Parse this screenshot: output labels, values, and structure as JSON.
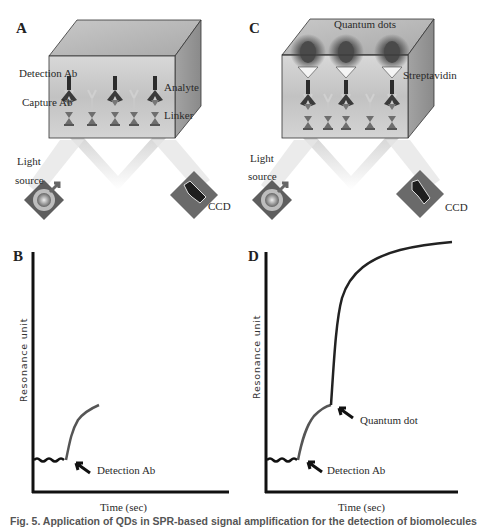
{
  "panels": {
    "A": {
      "letter": "A",
      "labels": {
        "detection_ab": "Detection Ab",
        "capture_ab": "Capture Ab",
        "analyte": "Analyte",
        "linker": "Linker",
        "light_source_1": "Light",
        "light_source_2": "source",
        "ccd": "CCD"
      }
    },
    "B": {
      "letter": "B",
      "ylabel": "Resonance unit",
      "xlabel": "Time (sec)",
      "annotations": [
        "Detection Ab"
      ]
    },
    "C": {
      "letter": "C",
      "labels": {
        "quantum_dots": "Quantum dots",
        "streptavidin": "Streptavidin",
        "light_source_1": "Light",
        "light_source_2": "source",
        "ccd": "CCD"
      }
    },
    "D": {
      "letter": "D",
      "ylabel": "Resonance unit",
      "xlabel": "Time (sec)",
      "annotations": [
        "Quantum dot",
        "Detection Ab"
      ]
    }
  },
  "caption": "Fig. 5. Application of QDs in SPR-based signal amplification for the detection of biomolecules",
  "colors": {
    "box_front": "#cfcfcf",
    "box_top": "#b5b5b5",
    "box_side": "#9a9a9a",
    "device": "#6a6a6a",
    "curve": "#444444",
    "axis": "#111111"
  }
}
